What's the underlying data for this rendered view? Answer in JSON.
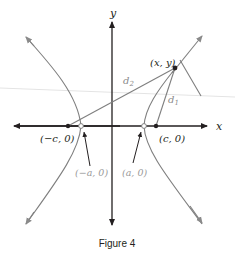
{
  "figure": {
    "caption": "Figure 4",
    "axes": {
      "x_label": "x",
      "y_label": "y"
    },
    "labels": {
      "point": "(x, y)",
      "d1": "d",
      "d1_sub": "1",
      "d2": "d",
      "d2_sub": "2",
      "focus_left": "(−c, 0)",
      "focus_right": "(c, 0)",
      "vertex_left": "(−a, 0)",
      "vertex_right": "(a, 0)"
    },
    "colors": {
      "axis": "#231f20",
      "curve": "#808080",
      "label_gray": "#9a9a9a",
      "text": "#231f20"
    }
  }
}
